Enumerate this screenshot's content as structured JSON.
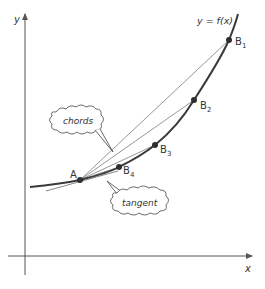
{
  "diagram": {
    "axes": {
      "x_label": "x",
      "y_label": "y"
    },
    "curve_label": "y = f(x)",
    "points": [
      {
        "id": "A",
        "label": "A",
        "sub": ""
      },
      {
        "id": "B1",
        "label": "B",
        "sub": "1"
      },
      {
        "id": "B2",
        "label": "B",
        "sub": "2"
      },
      {
        "id": "B3",
        "label": "B",
        "sub": "3"
      },
      {
        "id": "B4",
        "label": "B",
        "sub": "4"
      }
    ],
    "callouts": {
      "chords": "chords",
      "tangent": "tangent"
    },
    "colors": {
      "curve": "#3a3a3a",
      "axis": "#555555",
      "chord": "#6a6a6a",
      "point": "#2f2f2f",
      "text": "#333333"
    }
  }
}
